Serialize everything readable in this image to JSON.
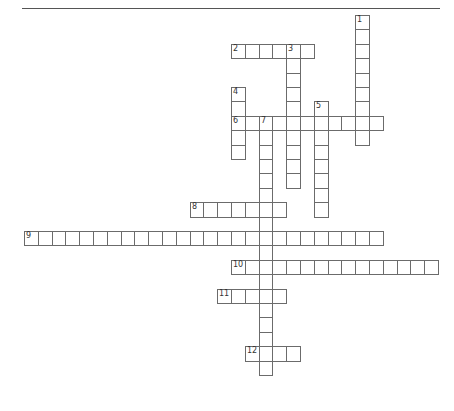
{
  "puzzle": {
    "type": "crossword",
    "grid": {
      "origin_x": 24,
      "origin_y": 15,
      "cell_w": 13.8,
      "cell_h": 14.4
    },
    "colors": {
      "line": "#6b6b6b",
      "number": "#333333",
      "rule": "#555555",
      "background": "#ffffff"
    },
    "words": [
      {
        "number": "1",
        "direction": "down",
        "col": 24,
        "row": 0,
        "length": 9
      },
      {
        "number": "2",
        "direction": "across",
        "col": 15,
        "row": 2,
        "length": 6
      },
      {
        "number": "3",
        "direction": "down",
        "col": 19,
        "row": 2,
        "length": 10
      },
      {
        "number": "4",
        "direction": "down",
        "col": 15,
        "row": 5,
        "length": 5
      },
      {
        "number": "5",
        "direction": "down",
        "col": 21,
        "row": 6,
        "length": 8
      },
      {
        "number": "6",
        "direction": "across",
        "col": 15,
        "row": 7,
        "length": 11
      },
      {
        "number": "7",
        "direction": "down",
        "col": 17,
        "row": 7,
        "length": 18
      },
      {
        "number": "8",
        "direction": "across",
        "col": 12,
        "row": 13,
        "length": 7
      },
      {
        "number": "9",
        "direction": "across",
        "col": 0,
        "row": 15,
        "length": 26
      },
      {
        "number": "10",
        "direction": "across",
        "col": 15,
        "row": 17,
        "length": 15
      },
      {
        "number": "11",
        "direction": "across",
        "col": 14,
        "row": 19,
        "length": 5
      },
      {
        "number": "12",
        "direction": "across",
        "col": 16,
        "row": 23,
        "length": 4
      }
    ]
  }
}
